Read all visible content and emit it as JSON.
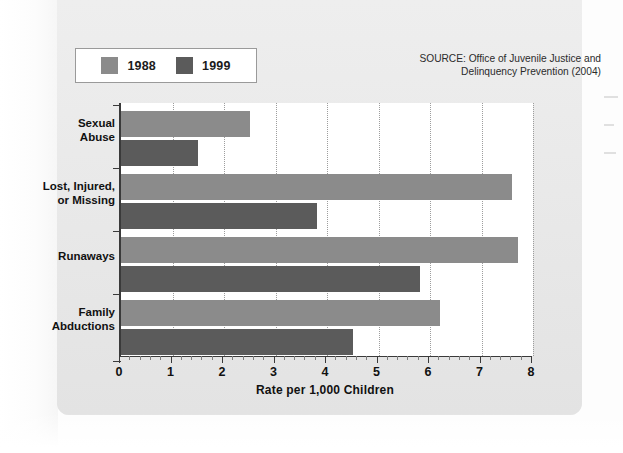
{
  "figure": {
    "source_note": "SOURCE: Office of Juvenile Justice and Delinquency Prevention (2004)"
  },
  "legend": {
    "items": [
      {
        "label": "1988",
        "color": "#8b8b8b"
      },
      {
        "label": "1999",
        "color": "#5b5b5b"
      }
    ]
  },
  "axis": {
    "x_title": "Rate per 1,000 Children",
    "ticks": [
      "0",
      "1",
      "2",
      "3",
      "4",
      "5",
      "6",
      "7",
      "8"
    ]
  },
  "categories": {
    "sexual_abuse_line1": "Sexual",
    "sexual_abuse_line2": "Abuse",
    "lost_line1": "Lost, Injured,",
    "lost_line2": "or Missing",
    "runaways_line1": "Runaways",
    "family_line1": "Family",
    "family_line2": "Abductions"
  },
  "chart_data": {
    "type": "bar",
    "orientation": "horizontal",
    "title": "",
    "subtitle": "",
    "xlabel": "Rate per 1,000 Children",
    "ylabel": "",
    "xlim": [
      0,
      8
    ],
    "xticks": [
      0,
      1,
      2,
      3,
      4,
      5,
      6,
      7,
      8
    ],
    "minor_tick_step": 0.2,
    "grid": "vertical-dotted",
    "legend_position": "top-left",
    "annotations": [
      "SOURCE: Office of Juvenile Justice and Delinquency Prevention (2004)"
    ],
    "categories": [
      "Sexual Abuse",
      "Lost, Injured, or Missing",
      "Runaways",
      "Family Abductions"
    ],
    "series": [
      {
        "name": "1988",
        "color": "#8b8b8b",
        "values": [
          2.5,
          7.6,
          7.7,
          6.2
        ]
      },
      {
        "name": "1999",
        "color": "#5b5b5b",
        "values": [
          1.5,
          3.8,
          5.8,
          4.5
        ]
      }
    ]
  }
}
